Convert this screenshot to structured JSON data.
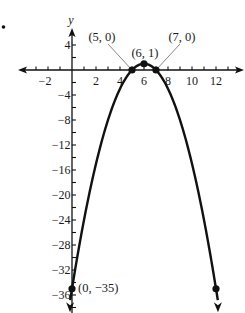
{
  "chart_data": {
    "type": "line",
    "title": "",
    "xlabel": "",
    "ylabel": "y",
    "equation": "y = -x^2 + 12x - 35",
    "xlim": [
      -4.3,
      14.3
    ],
    "ylim": [
      -39,
      6.4
    ],
    "grid": false,
    "legend": null,
    "x_ticks": [
      -3,
      -2,
      -1,
      1,
      2,
      3,
      4,
      5,
      6,
      7,
      8,
      9,
      10,
      11,
      12,
      13
    ],
    "x_tick_labels": [
      {
        "value": -2,
        "text": "−2"
      },
      {
        "value": 2,
        "text": "2"
      },
      {
        "value": 4,
        "text": "4"
      },
      {
        "value": 6,
        "text": "6"
      },
      {
        "value": 8,
        "text": "8"
      },
      {
        "value": 10,
        "text": "10"
      },
      {
        "value": 12,
        "text": "12"
      }
    ],
    "y_ticks": [
      4,
      2,
      -2,
      -4,
      -6,
      -8,
      -10,
      -12,
      -14,
      -16,
      -18,
      -20,
      -22,
      -24,
      -26,
      -28,
      -30,
      -32,
      -34,
      -36,
      -38
    ],
    "y_tick_labels": [
      {
        "value": 4,
        "text": "4"
      },
      {
        "value": -4,
        "text": "−4"
      },
      {
        "value": -8,
        "text": "−8"
      },
      {
        "value": -12,
        "text": "−12"
      },
      {
        "value": -16,
        "text": "−16"
      },
      {
        "value": -20,
        "text": "−20"
      },
      {
        "value": -24,
        "text": "−24"
      },
      {
        "value": -28,
        "text": "−28"
      },
      {
        "value": -32,
        "text": "−32"
      },
      {
        "value": -36,
        "text": "−36"
      }
    ],
    "series": [
      {
        "name": "parabola",
        "x": [
          0,
          1,
          2,
          3,
          4,
          5,
          6,
          7,
          8,
          9,
          10,
          11,
          12
        ],
        "y": [
          -35,
          -24,
          -15,
          -8,
          -3,
          0,
          1,
          0,
          -3,
          -8,
          -15,
          -24,
          -35
        ],
        "arrows_at_ends": true,
        "color": "#111111"
      }
    ],
    "labeled_points": [
      {
        "x": 5,
        "y": 0,
        "text": "(5, 0)",
        "leader_line": true
      },
      {
        "x": 6,
        "y": 1,
        "text": "(6, 1)",
        "leader_line": false
      },
      {
        "x": 7,
        "y": 0,
        "text": "(7, 0)",
        "leader_line": true
      },
      {
        "x": 0,
        "y": -35,
        "text": "(0, −35)",
        "leader_line": false
      },
      {
        "x": 12,
        "y": -35,
        "text": "",
        "leader_line": false
      }
    ],
    "annotations": [
      "•"
    ]
  },
  "colors": {
    "ink": "#111111",
    "leader": "#777777",
    "background": "#ffffff"
  }
}
